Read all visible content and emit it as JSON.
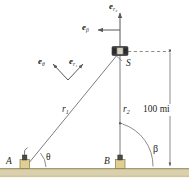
{
  "figure": {
    "background_color": "#ffffff",
    "line_color": "#6d6e71",
    "ground_color": "#d8cfae",
    "station_color": "#d9c98a",
    "satellite_color": "#3b3b3d",
    "text_color": "#231f20"
  },
  "labels": {
    "e_r2": {
      "symbol": "e",
      "subscript": "r₂"
    },
    "e_beta": {
      "symbol": "e",
      "subscript": "β"
    },
    "e_theta": {
      "symbol": "e",
      "subscript": "θ"
    },
    "e_r1": {
      "symbol": "e",
      "subscript": "r₁"
    },
    "r1": {
      "symbol": "r",
      "subscript": "1"
    },
    "r2": {
      "symbol": "r",
      "subscript": "2"
    },
    "satellite": "S",
    "station_a": "A",
    "station_b": "B",
    "angle_theta": "θ",
    "angle_beta": "β",
    "altitude": "100 mi"
  },
  "geometry": {
    "satellite_point": {
      "x": 120,
      "y": 52
    },
    "station_a_point": {
      "x": 24,
      "y": 168
    },
    "station_b_point": {
      "x": 120,
      "y": 168
    },
    "ground_y": 168,
    "altitude_value": 100,
    "altitude_unit": "mi"
  }
}
